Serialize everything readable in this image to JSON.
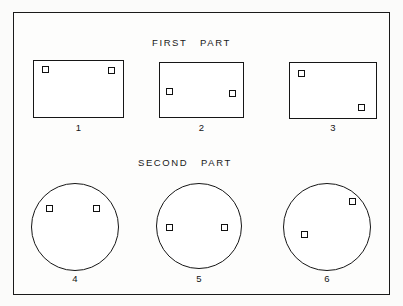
{
  "figure": {
    "background_color": "#fbfbfa",
    "line_color": "#161616",
    "frame": {
      "x": 13,
      "y": 12,
      "width": 377,
      "height": 283
    },
    "captions": [
      {
        "id": "first-part",
        "text": "FIRST   PART",
        "x": 152,
        "y": 38
      },
      {
        "id": "second-part",
        "text": "SECOND   PART",
        "x": 138,
        "y": 158
      }
    ],
    "parts": [
      {
        "label": "1",
        "shape": "rect",
        "x": 33,
        "y": 60,
        "width": 91,
        "height": 58,
        "label_x": 33,
        "label_y": 123,
        "label_width": 91,
        "markers": [
          {
            "name": "marker-top-left",
            "x": 9,
            "y": 6
          },
          {
            "name": "marker-top-right",
            "x": 75,
            "y": 7
          }
        ]
      },
      {
        "label": "2",
        "shape": "rect",
        "x": 159,
        "y": 62,
        "width": 85,
        "height": 56,
        "label_x": 159,
        "label_y": 123,
        "label_width": 85,
        "markers": [
          {
            "name": "marker-mid-left",
            "x": 7,
            "y": 26
          },
          {
            "name": "marker-mid-right",
            "x": 70,
            "y": 28
          }
        ]
      },
      {
        "label": "3",
        "shape": "rect",
        "x": 289,
        "y": 62,
        "width": 88,
        "height": 57,
        "label_x": 289,
        "label_y": 123,
        "label_width": 88,
        "markers": [
          {
            "name": "marker-top-left",
            "x": 9,
            "y": 8
          },
          {
            "name": "marker-bottom-right",
            "x": 69,
            "y": 42
          }
        ]
      },
      {
        "label": "4",
        "shape": "circle",
        "x": 31,
        "y": 183,
        "width": 88,
        "height": 88,
        "label_x": 31,
        "label_y": 274,
        "label_width": 88,
        "markers": [
          {
            "name": "marker-upper-left",
            "x": 15,
            "y": 22
          },
          {
            "name": "marker-upper-right",
            "x": 62,
            "y": 22
          }
        ]
      },
      {
        "label": "5",
        "shape": "circle",
        "x": 156,
        "y": 183,
        "width": 86,
        "height": 86,
        "label_x": 156,
        "label_y": 274,
        "label_width": 86,
        "markers": [
          {
            "name": "marker-mid-left",
            "x": 10,
            "y": 41
          },
          {
            "name": "marker-mid-right",
            "x": 65,
            "y": 41
          }
        ]
      },
      {
        "label": "6",
        "shape": "circle",
        "x": 283,
        "y": 183,
        "width": 88,
        "height": 88,
        "label_x": 283,
        "label_y": 274,
        "label_width": 88,
        "markers": [
          {
            "name": "marker-upper-right",
            "x": 66,
            "y": 15
          },
          {
            "name": "marker-lower-left",
            "x": 18,
            "y": 48
          }
        ]
      }
    ]
  }
}
